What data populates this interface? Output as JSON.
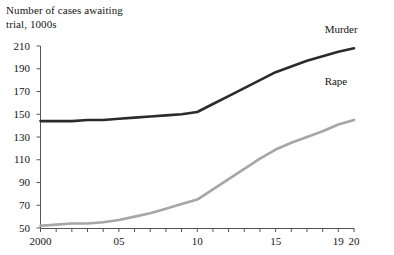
{
  "chart_data": {
    "type": "line",
    "title": "",
    "ylabel": "Number of cases awaiting trial, 1000s",
    "xlabel": "",
    "ylim": [
      50,
      210
    ],
    "xlim": [
      2000,
      2020
    ],
    "grid": false,
    "legend_position": "inline-right",
    "ytick_labels": [
      "210",
      "190",
      "170",
      "150",
      "130",
      "110",
      "90",
      "70",
      "50"
    ],
    "ytick_values": [
      210,
      190,
      170,
      150,
      130,
      110,
      90,
      70,
      50
    ],
    "xtick_labels": [
      "2000",
      "05",
      "10",
      "15",
      "19",
      "20"
    ],
    "xtick_values": [
      2000,
      2005,
      2010,
      2015,
      2019,
      2020
    ],
    "x": [
      2000,
      2001,
      2002,
      2003,
      2004,
      2005,
      2006,
      2007,
      2008,
      2009,
      2010,
      2011,
      2012,
      2013,
      2014,
      2015,
      2016,
      2017,
      2018,
      2019,
      2020
    ],
    "series": [
      {
        "name": "Murder",
        "color": "#2b2b2b",
        "values": [
          144,
          144,
          144,
          145,
          145,
          146,
          147,
          148,
          149,
          150,
          152,
          159,
          166,
          173,
          180,
          187,
          192,
          197,
          201,
          205,
          208
        ]
      },
      {
        "name": "Rape",
        "color": "#a6a6a6",
        "values": [
          52,
          53,
          54,
          54,
          55,
          57,
          60,
          63,
          67,
          71,
          75,
          84,
          93,
          102,
          111,
          119,
          125,
          130,
          135,
          141,
          145
        ]
      }
    ]
  },
  "labels": {
    "axis_title": "Number of cases awaiting\ntrial, 1000s",
    "murder": "Murder",
    "rape": "Rape"
  }
}
